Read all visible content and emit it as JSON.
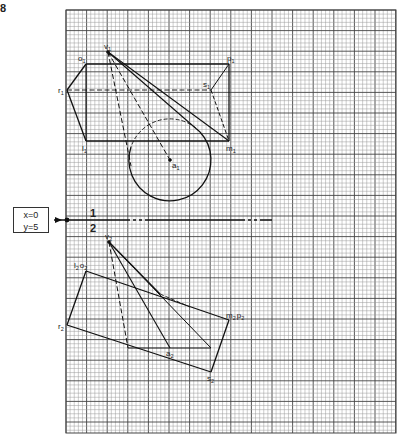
{
  "figure": {
    "number": "8"
  },
  "reference": {
    "box_lines": [
      "x=0",
      "y=5"
    ],
    "fold_line_labels": {
      "above": "1",
      "below": "2"
    }
  },
  "top_view": {
    "points": [
      {
        "name": "v",
        "sub": "1",
        "x": 108,
        "y": 52
      },
      {
        "name": "o",
        "sub": "1",
        "x": 86,
        "y": 64
      },
      {
        "name": "p",
        "sub": "1",
        "x": 229,
        "y": 64
      },
      {
        "name": "r",
        "sub": "1",
        "x": 67,
        "y": 90
      },
      {
        "name": "s",
        "sub": "1",
        "x": 211,
        "y": 90
      },
      {
        "name": "l",
        "sub": "1",
        "x": 86,
        "y": 141
      },
      {
        "name": "m",
        "sub": "1",
        "x": 229,
        "y": 141
      },
      {
        "name": "a",
        "sub": "1",
        "x": 170,
        "y": 160
      }
    ],
    "circle": {
      "cx": 170,
      "cy": 160,
      "r": 41
    }
  },
  "front_view": {
    "points": [
      {
        "name": "v",
        "sub": "2",
        "x": 109,
        "y": 242
      },
      {
        "name": "l",
        "sub": "2",
        "x": 86,
        "y": 271,
        "combined": "o"
      },
      {
        "name": "m",
        "sub": "2",
        "x": 229,
        "y": 320,
        "combined": "p"
      },
      {
        "name": "r",
        "sub": "2",
        "x": 67,
        "y": 325
      },
      {
        "name": "a",
        "sub": "2",
        "x": 170,
        "y": 348
      },
      {
        "name": "s",
        "sub": "2",
        "x": 211,
        "y": 372
      }
    ]
  },
  "labels": {
    "v1": "v",
    "o1": "o",
    "p1": "p",
    "r1": "r",
    "s1": "s",
    "l1": "l",
    "m1": "m",
    "a1": "a",
    "v2": "v",
    "l2o2": "l",
    "o2": "o",
    "m2p2": "m",
    "p2": "p",
    "r2": "r",
    "a2": "a",
    "s2": "s",
    "sub1": "1",
    "sub2": "2"
  },
  "grid": {
    "left": 66,
    "top": 10,
    "right": 396,
    "bottom": 433,
    "minor_step": 4.12,
    "major_every": 5,
    "minor_color": "#9a9a9a",
    "major_color": "#444444"
  }
}
